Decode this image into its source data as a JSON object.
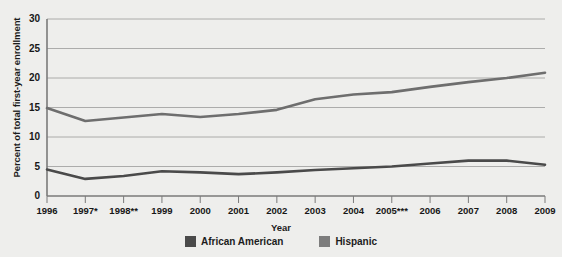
{
  "chart_data": {
    "type": "line",
    "title": "",
    "xlabel": "Year",
    "ylabel": "Percent of total first-year enrollment",
    "categories": [
      "1996",
      "1997*",
      "1998**",
      "1999",
      "2000",
      "2001",
      "2002",
      "2003",
      "2004",
      "2005***",
      "2006",
      "2007",
      "2008",
      "2009"
    ],
    "x": [
      1996,
      1997,
      1998,
      1999,
      2000,
      2001,
      2002,
      2003,
      2004,
      2005,
      2006,
      2007,
      2008,
      2009
    ],
    "series": [
      {
        "name": "African American",
        "color": "#4a4a4a",
        "values": [
          4.5,
          2.9,
          3.4,
          4.2,
          4.0,
          3.7,
          4.0,
          4.4,
          4.7,
          5.0,
          5.5,
          6.0,
          6.0,
          5.3
        ]
      },
      {
        "name": "Hispanic",
        "color": "#6e6e6e",
        "values": [
          14.9,
          12.7,
          13.3,
          13.9,
          13.4,
          13.9,
          14.6,
          16.4,
          17.2,
          17.6,
          18.5,
          19.3,
          20.0,
          20.9
        ]
      }
    ],
    "ylim": [
      0,
      30
    ],
    "yticks": [
      0,
      5,
      10,
      15,
      20,
      25,
      30
    ],
    "ytick_labels": [
      "0",
      "5",
      "10",
      "15",
      "20",
      "25",
      "30"
    ],
    "grid": true,
    "legend_position": "bottom"
  },
  "legend": {
    "entries": [
      {
        "label": "African American",
        "color": "#4a4a4a"
      },
      {
        "label": "Hispanic",
        "color": "#7d7d7d"
      }
    ]
  },
  "colors": {
    "background": "#eeeeec",
    "plot_background": "#ececea",
    "gridline": "#9a9a9a",
    "axis": "#7a7a7a",
    "text": "#171717"
  }
}
